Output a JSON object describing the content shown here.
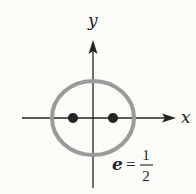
{
  "diagram": {
    "axes": {
      "x_label": "x",
      "y_label": "y"
    },
    "eccentricity": {
      "lhs": "e",
      "eq": "=",
      "numerator": "1",
      "denominator": "2"
    },
    "colors": {
      "ellipse": "#9a9a9a",
      "axes": "#222222",
      "foci": "#222222",
      "background": "#fbfbf8"
    },
    "foci_count": 2
  }
}
